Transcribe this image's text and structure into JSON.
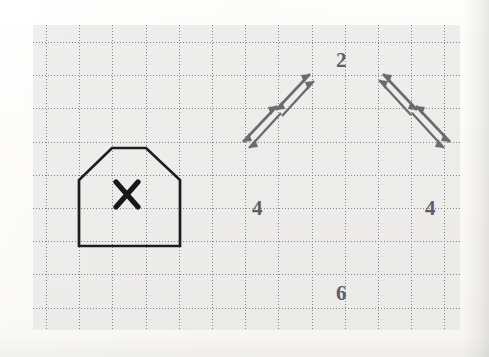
{
  "document": {
    "kind": "scanned-worksheet",
    "background_color": "#fdfcfa",
    "grid_panel_color": "#e4e4e2",
    "grid_line_color": "#84848 7"
  },
  "grid": {
    "cell_size_px": 33.2,
    "columns": 13,
    "rows": 9,
    "style": "dotted"
  },
  "figures": {
    "small_shape": {
      "name": "small-pentagon",
      "stroke_color": "#1f1f22",
      "stroke_width": 2.6,
      "marker": "X",
      "marker_color": "#1b1b1d",
      "points": "79,246 79,180 112,148 146,148 180,180 180,246"
    },
    "large_shape": {
      "name": "large-pentagon",
      "stroke_color": "#5f5f63",
      "stroke_width": 2.6,
      "points": "246,279 246,146 312,76 380,76 447,146 447,279",
      "labels": {
        "top": "2",
        "left": "4",
        "right": "4",
        "bottom": "6"
      }
    },
    "arrows": {
      "color": "#6a6a6e",
      "style": "double-headed",
      "left_diagonal_count": 2,
      "right_diagonal_count": 2
    }
  },
  "label_positions": {
    "top": {
      "text": "2",
      "x": 336,
      "y": 50
    },
    "left": {
      "text": "4",
      "x": 252,
      "y": 198
    },
    "right": {
      "text": "4",
      "x": 425,
      "y": 198
    },
    "bottom": {
      "text": "6",
      "x": 336,
      "y": 283
    },
    "x_mark": {
      "text": "X",
      "x": 115,
      "y": 180
    }
  }
}
